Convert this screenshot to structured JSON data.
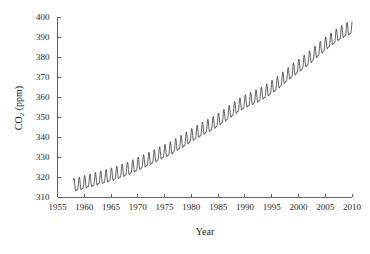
{
  "chart_data": {
    "type": "line",
    "title": "",
    "xlabel": "Year",
    "ylabel": "CO2 (ppm)",
    "ylabel_base": "CO",
    "ylabel_sub": "2",
    "ylabel_unit": " (ppm)",
    "xlim": [
      1955,
      2010
    ],
    "ylim": [
      310,
      400
    ],
    "grid": false,
    "legend": null,
    "legend_position": "none",
    "line_color": "#2b2b2b",
    "axis_color": "#555555",
    "background_color": "#ffffff",
    "xticks": [
      1955,
      1960,
      1965,
      1970,
      1975,
      1980,
      1985,
      1990,
      1995,
      2000,
      2005,
      2010
    ],
    "xtick_labels": [
      "1955",
      "1960",
      "1965",
      "1970",
      "1975",
      "1980",
      "1985",
      "1990",
      "1995",
      "2000",
      "2005",
      "2010"
    ],
    "yticks": [
      310,
      320,
      330,
      340,
      350,
      360,
      370,
      380,
      390,
      400
    ],
    "ytick_labels": [
      "310",
      "320",
      "330",
      "340",
      "350",
      "360",
      "370",
      "380",
      "390",
      "400"
    ],
    "series_name": "Atmospheric CO2 concentration",
    "seasonal_amplitude_ppm": 3.0,
    "x": [
      1958.0,
      1958.5,
      1959.0,
      1959.5,
      1960.0,
      1960.5,
      1961.0,
      1961.5,
      1962.0,
      1962.5,
      1963.0,
      1963.5,
      1964.0,
      1964.5,
      1965.0,
      1965.5,
      1966.0,
      1966.5,
      1967.0,
      1967.5,
      1968.0,
      1968.5,
      1969.0,
      1969.5,
      1970.0,
      1970.5,
      1971.0,
      1971.5,
      1972.0,
      1972.5,
      1973.0,
      1973.5,
      1974.0,
      1974.5,
      1975.0,
      1975.5,
      1976.0,
      1976.5,
      1977.0,
      1977.5,
      1978.0,
      1978.5,
      1979.0,
      1979.5,
      1980.0,
      1980.5,
      1981.0,
      1981.5,
      1982.0,
      1982.5,
      1983.0,
      1983.5,
      1984.0,
      1984.5,
      1985.0,
      1985.5,
      1986.0,
      1986.5,
      1987.0,
      1987.5,
      1988.0,
      1988.5,
      1989.0,
      1989.5,
      1990.0,
      1990.5,
      1991.0,
      1991.5,
      1992.0,
      1992.5,
      1993.0,
      1993.5,
      1994.0,
      1994.5,
      1995.0,
      1995.5,
      1996.0,
      1996.5,
      1997.0,
      1997.5,
      1998.0,
      1998.5,
      1999.0,
      1999.5,
      2000.0,
      2000.5,
      2001.0,
      2001.5,
      2002.0,
      2002.5,
      2003.0,
      2003.5,
      2004.0,
      2004.5,
      2005.0,
      2005.5,
      2006.0,
      2006.5,
      2007.0,
      2007.5,
      2008.0,
      2008.5,
      2009.0,
      2009.5,
      2010.0
    ],
    "annual_mean": [
      315.0,
      315.3,
      315.6,
      316.0,
      316.4,
      316.8,
      317.2,
      317.5,
      317.9,
      318.3,
      318.7,
      319.0,
      319.4,
      319.8,
      320.2,
      320.6,
      321.1,
      321.6,
      322.1,
      322.6,
      323.1,
      323.6,
      324.2,
      324.8,
      325.5,
      326.1,
      326.7,
      327.3,
      328.0,
      328.6,
      329.3,
      330.0,
      330.7,
      331.3,
      331.9,
      332.5,
      333.2,
      334.0,
      334.8,
      335.6,
      336.4,
      337.2,
      338.0,
      338.9,
      339.8,
      340.6,
      341.4,
      342.2,
      343.0,
      343.7,
      344.4,
      345.1,
      345.9,
      346.7,
      347.6,
      348.5,
      349.4,
      350.3,
      351.3,
      352.3,
      353.3,
      354.2,
      355.1,
      355.9,
      356.7,
      357.3,
      357.9,
      358.5,
      359.2,
      359.8,
      360.5,
      361.3,
      362.1,
      363.0,
      363.9,
      364.9,
      365.9,
      367.0,
      368.1,
      369.2,
      370.3,
      371.4,
      372.4,
      373.4,
      374.4,
      375.4,
      376.4,
      377.5,
      378.6,
      379.7,
      380.9,
      382.1,
      383.3,
      384.4,
      385.5,
      386.6,
      387.6,
      388.6,
      389.6,
      390.5,
      391.3,
      392.1,
      392.8,
      393.4,
      394.0
    ],
    "value_start_1958": 315.0,
    "value_end_2010": 390.0
  }
}
